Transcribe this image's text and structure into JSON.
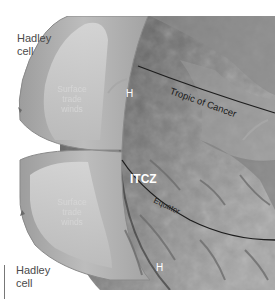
{
  "diagram": {
    "title": "",
    "labels": {
      "hadley_cell_top": "Hadley\ncell",
      "hadley_cell_bottom": "Hadley\ncell",
      "surface_trade_winds_top": "Surface\ntrade\nwinds",
      "surface_trade_winds_bottom": "Surface\ntrade\nwinds",
      "high_pressure_top": "H",
      "high_pressure_bottom": "H",
      "itcz": "ITCZ",
      "tropic_of_cancer": "Tropic of Cancer",
      "equator": "Equator"
    },
    "colors": {
      "background": "#ffffff",
      "globe_dark": "#4f4f4f",
      "globe_mid": "#7d7d7d",
      "globe_light": "#a9a9a9",
      "cell_fill": "#b9b9b9",
      "cell_inner": "#cfcfcf",
      "cell_edge": "#8a8a8a",
      "latitude_line": "#1e1e1e",
      "label_dark": "#4a4a4a",
      "label_white": "#ffffff"
    }
  }
}
